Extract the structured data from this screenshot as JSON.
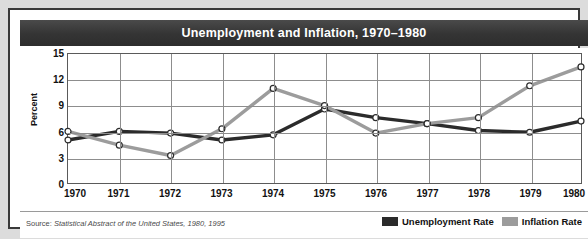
{
  "title": "Unemployment and Inflation, 1970–1980",
  "source": {
    "prefix": "Source:",
    "italic": "Statistical Abstract of the United States, 1980, 1995"
  },
  "axes": {
    "ylabel": "Percent",
    "yticks": [
      "0",
      "3",
      "6",
      "9",
      "12",
      "15"
    ],
    "xticks": [
      "1970",
      "1971",
      "1972",
      "1973",
      "1974",
      "1975",
      "1976",
      "1977",
      "1978",
      "1979",
      "1980"
    ]
  },
  "legend": [
    {
      "label": "Unemployment Rate",
      "color": "#2b2b2b"
    },
    {
      "label": "Inflation Rate",
      "color": "#9c9c9c"
    }
  ],
  "chart_data": {
    "type": "line",
    "title": "Unemployment and Inflation, 1970–1980",
    "xlabel": "",
    "ylabel": "Percent",
    "ylim": [
      0,
      15
    ],
    "yticks": [
      0,
      3,
      6,
      9,
      12,
      15
    ],
    "grid": true,
    "legend_position": "bottom-right",
    "markers": "open-circle",
    "categories": [
      1970,
      1971,
      1972,
      1973,
      1974,
      1975,
      1976,
      1977,
      1978,
      1979,
      1980
    ],
    "series": [
      {
        "name": "Unemployment Rate",
        "color": "#2b2b2b",
        "values": [
          5.0,
          6.0,
          5.8,
          5.0,
          5.6,
          8.6,
          7.6,
          6.9,
          6.1,
          5.9,
          7.2
        ]
      },
      {
        "name": "Inflation Rate",
        "color": "#9c9c9c",
        "values": [
          6.0,
          4.4,
          3.2,
          6.3,
          11.0,
          9.0,
          5.8,
          6.9,
          7.6,
          11.3,
          13.5
        ]
      }
    ]
  }
}
